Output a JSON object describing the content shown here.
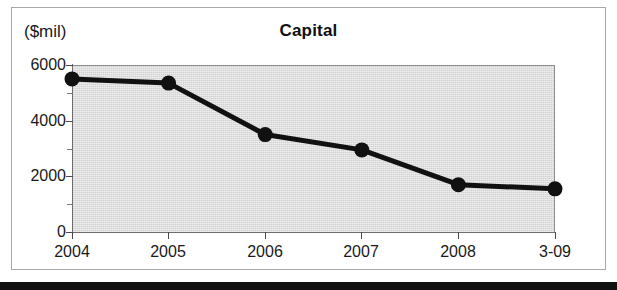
{
  "figure": {
    "unit_label": "($mil)",
    "title": "Capital"
  },
  "chart_data": {
    "type": "line",
    "title": "Capital",
    "subtitle": "",
    "xlabel": "",
    "ylabel": "($mil)",
    "ylim": [
      0,
      6000
    ],
    "y_ticks": [
      0,
      2000,
      4000,
      6000
    ],
    "y_minor_ticks": [
      1000,
      3000,
      5000
    ],
    "grid": false,
    "legend": "none",
    "categories": [
      "2004",
      "2005",
      "2006",
      "2007",
      "2008",
      "3-09"
    ],
    "values": [
      5500,
      5350,
      3500,
      2950,
      1700,
      1550
    ],
    "series": [
      {
        "name": "Capital",
        "values": [
          5500,
          5350,
          3500,
          2950,
          1700,
          1550
        ],
        "line_color": "#111111",
        "marker": "circle",
        "marker_color": "#111111"
      }
    ],
    "plot_background": "#d2d2d2",
    "annotations": []
  },
  "axis": {
    "y_tick_labels": [
      "6000",
      "4000",
      "2000",
      "0"
    ],
    "x_tick_labels": [
      "2004",
      "2005",
      "2006",
      "2007",
      "2008",
      "3-09"
    ]
  }
}
